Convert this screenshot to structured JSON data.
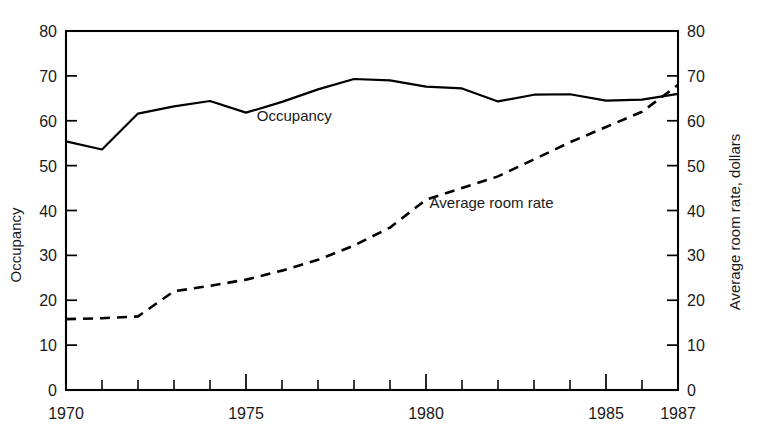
{
  "chart_data": {
    "type": "line",
    "title": "",
    "subtitle": "",
    "xlabel": "",
    "ylabel": "Occupancy",
    "y2label": "Average room rate, dollars",
    "xlim": [
      1970,
      1987
    ],
    "ylim": [
      0,
      80
    ],
    "y2lim": [
      0,
      80
    ],
    "grid": false,
    "legend_position": "inline-annotations",
    "x": [
      1970,
      1971,
      1972,
      1973,
      1974,
      1975,
      1976,
      1977,
      1978,
      1979,
      1980,
      1981,
      1982,
      1983,
      1984,
      1985,
      1986,
      1987
    ],
    "xticks_major": [
      1970,
      1975,
      1980,
      1985,
      1987
    ],
    "xtick_labels": [
      "1970",
      "1975",
      "1980",
      "1985",
      "1987"
    ],
    "yticks": [
      0,
      10,
      20,
      30,
      40,
      50,
      60,
      70,
      80
    ],
    "ytick_labels": [
      "0",
      "10",
      "20",
      "30",
      "40",
      "50",
      "60",
      "70",
      "80"
    ],
    "y2ticks": [
      0,
      10,
      20,
      30,
      40,
      50,
      60,
      70,
      80
    ],
    "y2tick_labels": [
      "0",
      "10",
      "20",
      "30",
      "40",
      "50",
      "60",
      "70",
      "80"
    ],
    "series": [
      {
        "name": "Occupancy",
        "axis": "left",
        "style": "solid",
        "label_text": "Occupancy",
        "values": [
          55.4,
          53.6,
          61.6,
          63.2,
          64.4,
          61.8,
          64.2,
          67.0,
          69.3,
          69.0,
          67.6,
          67.2,
          64.3,
          65.8,
          65.9,
          64.5,
          64.7,
          66.0
        ]
      },
      {
        "name": "Average room rate",
        "axis": "right",
        "style": "dashed",
        "label_text": "Average room rate",
        "values": [
          15.8,
          16.0,
          16.4,
          22.0,
          23.2,
          24.6,
          26.6,
          29.0,
          32.2,
          36.2,
          42.4,
          45.0,
          47.6,
          51.4,
          55.2,
          58.6,
          62.0,
          68.0
        ]
      }
    ],
    "annotations": [
      {
        "text": "Occupancy",
        "x": 1975.3,
        "y": 60.0
      },
      {
        "text": "Average room rate",
        "x": 1980.1,
        "y": 40.5
      }
    ]
  },
  "colors": {
    "ink": "#000000",
    "text": "#1a1a1a",
    "background": "#ffffff"
  }
}
